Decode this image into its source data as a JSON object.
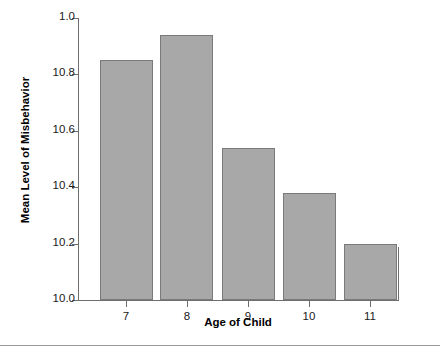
{
  "chart_data": {
    "type": "bar",
    "title": "",
    "subtitle": "",
    "xlabel": "Age of Child",
    "ylabel": "Mean Level of Misbehavior",
    "categories": [
      "7",
      "8",
      "9",
      "10",
      "11"
    ],
    "values": [
      10.85,
      10.94,
      10.54,
      10.38,
      10.2
    ],
    "series": [
      {
        "name": "Mean Level of Misbehavior",
        "values": [
          10.85,
          10.94,
          10.54,
          10.38,
          10.2
        ]
      }
    ],
    "ylim": [
      10.0,
      11.0
    ],
    "ytick_labels": [
      "1.0",
      "10.8",
      "10.6",
      "10.4",
      "10.2",
      "10.0"
    ],
    "ytick_values": [
      11.0,
      10.8,
      10.6,
      10.4,
      10.2,
      10.0
    ],
    "xtick_labels": [
      "7",
      "8",
      "9",
      "10",
      "11"
    ],
    "grid": false,
    "legend": false,
    "legend_position": "none",
    "bar_color": "#a8a8a8",
    "bar_edge_color": "#7a7a7a",
    "axis_color": "#6e6e6e",
    "background_color": "#ffffff",
    "text_color": "#1a1a1a"
  }
}
